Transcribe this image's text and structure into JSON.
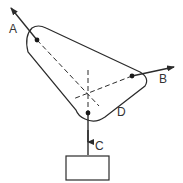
{
  "diagram": {
    "type": "free-body / force diagram",
    "colors": {
      "line": "#2b2b2b",
      "background": "#ffffff"
    },
    "labels": {
      "a": "A",
      "b": "B",
      "c": "C",
      "d": "D"
    },
    "elements": {
      "plate": "triangular rounded plate",
      "force_a": "arrow from pin A pointing up-left",
      "force_b": "arrow from pin B pointing right",
      "force_c": "vertical string from pin C down to weight box",
      "weight": "rectangular block hanging below C",
      "lines_of_action": "dashed lines meeting at a common point"
    }
  }
}
